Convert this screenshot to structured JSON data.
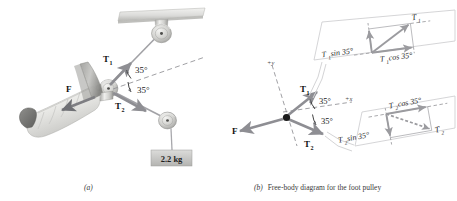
{
  "figure": {
    "panel_a": {
      "caption": "(a)",
      "labels": {
        "T1": "T",
        "T1_sub": "1",
        "T2": "T",
        "T2_sub": "2",
        "F": "F",
        "angle_upper": "35°",
        "angle_lower": "35°",
        "mass": "2.2 kg"
      },
      "description_parts": [
        "ceiling-bracket",
        "upper-pulley",
        "foot-pulley",
        "lower-pulley",
        "bandaged-leg",
        "hanging-mass"
      ]
    },
    "panel_b": {
      "caption_marker": "(b)",
      "caption_text": "Free-body diagram for the foot pulley",
      "labels": {
        "axis_y": "+y",
        "axis_x": "+x",
        "T1": "T",
        "T1_sub": "1",
        "T2": "T",
        "T2_sub": "2",
        "F": "F",
        "angle_upper": "35°",
        "angle_lower": "35°"
      },
      "callout_top": {
        "vector": "T",
        "vector_sub": "1",
        "component_vertical": "T₁ sin 35°",
        "component_horizontal": "T₁ cos 35°",
        "comp_v_main": "T",
        "comp_v_sub": "1",
        "comp_v_rest": " sin 35°",
        "comp_h_main": "T",
        "comp_h_sub": "1",
        "comp_h_rest": " cos 35°"
      },
      "callout_bottom": {
        "vector": "T",
        "vector_sub": "2",
        "component_vertical": "T₂ sin 35°",
        "component_horizontal": "T₂ cos 35°",
        "comp_v_main": "T",
        "comp_v_sub": "2",
        "comp_v_rest": " sin 35°",
        "comp_h_main": "T",
        "comp_h_sub": "2",
        "comp_h_rest": " cos 35°"
      }
    },
    "colors": {
      "vector_gray": "#8e8e93",
      "vector_dark": "#6f7074",
      "label_black": "#1b1b1b",
      "dash_gray": "#9a9a9e",
      "callout_border": "#d0d0d2",
      "apparatus_light": "#e6e6e4",
      "apparatus_mid": "#b9b9b6",
      "apparatus_dark": "#7d7d7a",
      "mass_box": "#c9c9c7",
      "background": "#ffffff"
    }
  }
}
